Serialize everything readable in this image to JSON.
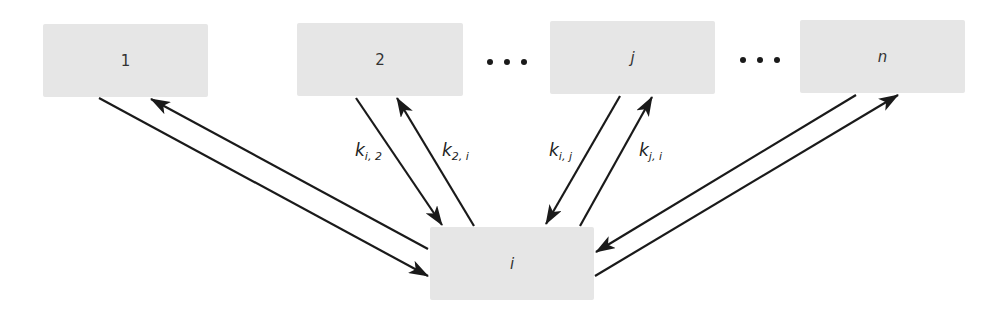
{
  "nodes": [
    {
      "id": "1",
      "label": "1"
    },
    {
      "id": "2",
      "label": "2"
    },
    {
      "id": "j",
      "label": "j"
    },
    {
      "id": "n",
      "label": "n"
    },
    {
      "id": "i",
      "label": "i"
    }
  ],
  "ellipses": [
    "...",
    "..."
  ],
  "edge_labels": {
    "k_i2": {
      "base": "k",
      "sub": "i, 2"
    },
    "k_2i": {
      "base": "k",
      "sub": "2, i"
    },
    "k_ij": {
      "base": "k",
      "sub": "i, j"
    },
    "k_ji": {
      "base": "k",
      "sub": "j, i"
    }
  },
  "edges": [
    {
      "from": "1",
      "to": "i"
    },
    {
      "from": "i",
      "to": "1"
    },
    {
      "from": "2",
      "to": "i",
      "label": "k_i2"
    },
    {
      "from": "i",
      "to": "2",
      "label": "k_2i"
    },
    {
      "from": "j",
      "to": "i",
      "label": "k_ij"
    },
    {
      "from": "i",
      "to": "j",
      "label": "k_ji"
    },
    {
      "from": "n",
      "to": "i"
    },
    {
      "from": "i",
      "to": "n"
    }
  ],
  "colors": {
    "node_fill": "#e6e6e6",
    "edge": "#1a1a1a",
    "text": "#333333"
  }
}
